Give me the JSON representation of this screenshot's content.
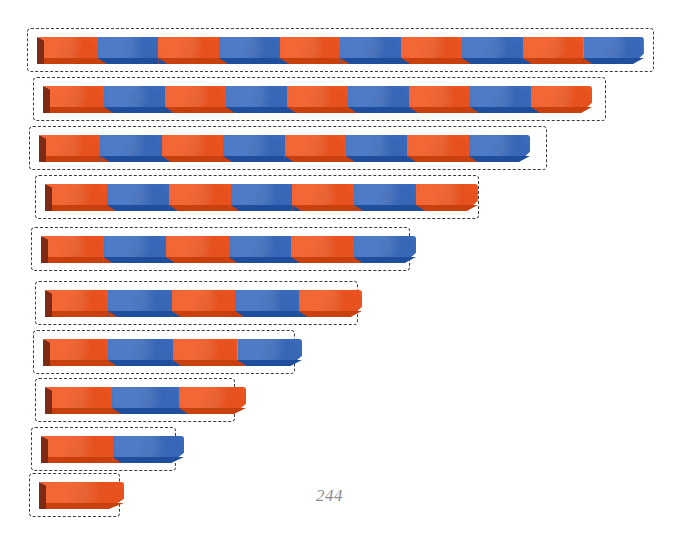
{
  "page": {
    "background_color": "#ffffff",
    "page_number": "244",
    "page_number_position": {
      "x": 316,
      "y": 486
    },
    "width": 680,
    "height": 539
  },
  "palette": {
    "orange": "#F2551F",
    "orange_bevel": "#C9400F",
    "blue": "#3B6CC0",
    "blue_bevel": "#1F4E9C",
    "rod_left_shadow": "#7D2B15",
    "dash_stroke": "#3C3C3C",
    "page_number_color": "#8E8E92"
  },
  "chart_data": {
    "type": "bar",
    "title": "",
    "xlabel": "",
    "ylabel": "",
    "orientation": "horizontal",
    "unit_segment_px": 58,
    "categories": [
      "10",
      "9",
      "8",
      "7",
      "6",
      "5",
      "4",
      "3",
      "2",
      "1"
    ],
    "values": [
      10,
      9,
      8,
      7,
      6,
      5,
      4,
      3,
      2,
      1
    ],
    "segment_colors_key": {
      "odd": "orange",
      "even": "blue"
    }
  },
  "bars": [
    {
      "name": "bar-10",
      "segments": 10,
      "colors": [
        "orange",
        "blue",
        "orange",
        "blue",
        "orange",
        "blue",
        "orange",
        "blue",
        "orange",
        "blue"
      ],
      "box": {
        "x": 27,
        "y": 28,
        "w": 627,
        "h": 44
      },
      "rod": {
        "x": 10,
        "y": 9,
        "w": 607,
        "h": 27
      }
    },
    {
      "name": "bar-9",
      "segments": 9,
      "colors": [
        "orange",
        "blue",
        "orange",
        "blue",
        "orange",
        "blue",
        "orange",
        "blue",
        "orange"
      ],
      "box": {
        "x": 33,
        "y": 77,
        "w": 573,
        "h": 44
      },
      "rod": {
        "x": 10,
        "y": 9,
        "w": 549,
        "h": 27
      }
    },
    {
      "name": "bar-8",
      "segments": 8,
      "colors": [
        "orange",
        "blue",
        "orange",
        "blue",
        "orange",
        "blue",
        "orange",
        "blue"
      ],
      "box": {
        "x": 29,
        "y": 126,
        "w": 518,
        "h": 44
      },
      "rod": {
        "x": 10,
        "y": 9,
        "w": 491,
        "h": 27
      }
    },
    {
      "name": "bar-7",
      "segments": 7,
      "colors": [
        "orange",
        "blue",
        "orange",
        "blue",
        "orange",
        "blue",
        "orange"
      ],
      "box": {
        "x": 35,
        "y": 175,
        "w": 444,
        "h": 44
      },
      "rod": {
        "x": 10,
        "y": 9,
        "w": 433,
        "h": 27
      }
    },
    {
      "name": "bar-6",
      "segments": 6,
      "colors": [
        "orange",
        "blue",
        "orange",
        "blue",
        "orange",
        "blue"
      ],
      "box": {
        "x": 31,
        "y": 227,
        "w": 379,
        "h": 44
      },
      "rod": {
        "x": 10,
        "y": 9,
        "w": 375,
        "h": 27
      }
    },
    {
      "name": "bar-5",
      "segments": 5,
      "colors": [
        "orange",
        "blue",
        "orange",
        "blue",
        "orange"
      ],
      "box": {
        "x": 35,
        "y": 281,
        "w": 323,
        "h": 44
      },
      "rod": {
        "x": 10,
        "y": 9,
        "w": 317,
        "h": 27
      }
    },
    {
      "name": "bar-4",
      "segments": 4,
      "colors": [
        "orange",
        "blue",
        "orange",
        "blue"
      ],
      "box": {
        "x": 33,
        "y": 330,
        "w": 262,
        "h": 44
      },
      "rod": {
        "x": 10,
        "y": 9,
        "w": 259,
        "h": 27
      }
    },
    {
      "name": "bar-3",
      "segments": 3,
      "colors": [
        "orange",
        "blue",
        "orange"
      ],
      "box": {
        "x": 35,
        "y": 378,
        "w": 200,
        "h": 44
      },
      "rod": {
        "x": 10,
        "y": 9,
        "w": 201,
        "h": 27
      }
    },
    {
      "name": "bar-2",
      "segments": 2,
      "colors": [
        "orange",
        "blue"
      ],
      "box": {
        "x": 31,
        "y": 427,
        "w": 145,
        "h": 44
      },
      "rod": {
        "x": 10,
        "y": 9,
        "w": 143,
        "h": 27
      }
    },
    {
      "name": "bar-1",
      "segments": 1,
      "colors": [
        "orange"
      ],
      "box": {
        "x": 29,
        "y": 473,
        "w": 91,
        "h": 44
      },
      "rod": {
        "x": 10,
        "y": 9,
        "w": 85,
        "h": 27
      }
    }
  ]
}
